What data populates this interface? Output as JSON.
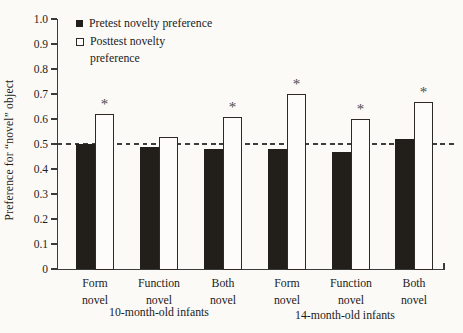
{
  "figure": {
    "background": "#fbfaf7",
    "axis_color": "#3b3b3b",
    "text_color": "#1c1c1c"
  },
  "chart_data": {
    "type": "bar",
    "title": "",
    "xlabel": "",
    "ylabel": "Preference for “novel” object",
    "ylim": [
      0,
      1.0
    ],
    "yticks": [
      "1.0",
      "0.9",
      "0.8",
      "0.7",
      "0.6",
      "0.5",
      "0.4",
      "0.3",
      "0.2",
      "0.1",
      "0"
    ],
    "grid": false,
    "reference_line_y": 0.5,
    "reference_line_style": "dashed",
    "categories": [
      "Form novel",
      "Function novel",
      "Both novel",
      "Form novel",
      "Function novel",
      "Both novel"
    ],
    "category_groups": [
      {
        "label": "10-month-old infants",
        "categories_span": [
          0,
          2
        ]
      },
      {
        "label": "14-month-old infants",
        "categories_span": [
          3,
          5
        ]
      }
    ],
    "series": [
      {
        "name": "Pretest novelty preference",
        "marker": "filled-square",
        "color": "#221e19",
        "values": [
          0.5,
          0.49,
          0.48,
          0.48,
          0.47,
          0.52
        ]
      },
      {
        "name": "Posttest novelty preference",
        "marker": "open-square",
        "color": "#ffffff",
        "border_color": "#2c2927",
        "values": [
          0.62,
          0.53,
          0.61,
          0.7,
          0.6,
          0.67
        ],
        "significance": [
          true,
          false,
          true,
          true,
          true,
          true
        ]
      }
    ],
    "significance_marker": "*",
    "legend": {
      "position": "top-left-inside",
      "items": [
        {
          "marker": "filled-square",
          "lines": [
            "Pretest novelty preference"
          ]
        },
        {
          "marker": "open-square",
          "lines": [
            "Posttest novelty",
            "preference"
          ]
        }
      ]
    }
  }
}
